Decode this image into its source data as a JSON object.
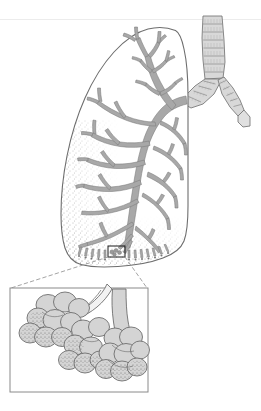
{
  "figure": {
    "type": "anatomical-illustration",
    "background_color": "#ffffff",
    "width": 261,
    "height": 411
  },
  "palette": {
    "outline": "#6e6e6e",
    "airway_fill": "#a8a8a8",
    "airway_stroke": "#7a7a7a",
    "cartilage_fill": "#d8d8d8",
    "cartilage_stroke": "#8a8a8a",
    "alveoli_fill": "#cfcfcf",
    "alveoli_stroke": "#6e6e6e",
    "stipple": "#4a4a4a",
    "panel_border": "#8a8a8a",
    "leader_line": "#9a9a9a",
    "scan_artifact": "#ececec"
  },
  "parts": {
    "trachea": {
      "name": "trachea",
      "ring_count": 7,
      "description": "Vertical airway at upper right with horizontal cartilage rings"
    },
    "right_main_bronchus": {
      "name": "right-main-bronchus",
      "ring_count": 5,
      "description": "Short branch angling down-right from the carina"
    },
    "left_main_bronchus": {
      "name": "left-main-bronchus",
      "ring_count": 4,
      "description": "Branch angling down-left into the lung hilum"
    },
    "lung": {
      "name": "lung-outline",
      "description": "Single lung silhouette, apex upper right, base lower left"
    },
    "bronchial_tree": {
      "name": "bronchial-tree",
      "description": "Branching gray airway tree filling the lung, tapering to terminal bronchioles"
    },
    "stipple_field": {
      "name": "parenchyma-stipple",
      "description": "Dotted texture along the anterior and basal lung margins representing parenchyma"
    },
    "marker_box": {
      "name": "detail-marker-box",
      "description": "Small rectangle near the lung base marking the magnified region",
      "x": 108,
      "y": 246,
      "width": 17,
      "height": 11
    },
    "leader_lines": {
      "name": "magnification-leader-lines",
      "style": "dashed",
      "description": "Two dashed lines from the marker box corners to the inset panel corners"
    },
    "inset_panel": {
      "name": "alveoli-inset-panel",
      "x": 10,
      "y": 288,
      "width": 138,
      "height": 104,
      "description": "Framed magnified view of alveolar ducts, sacs and alveoli"
    },
    "alveolar_duct": {
      "name": "alveolar-duct",
      "description": "Pale branching duct entering from the top right of the inset"
    },
    "alveolar_clusters": {
      "name": "alveolar-sac-cluster",
      "count": 3,
      "description": "Grape-like clusters of rounded alveoli, stippled to suggest capillary beds"
    }
  },
  "captions": []
}
